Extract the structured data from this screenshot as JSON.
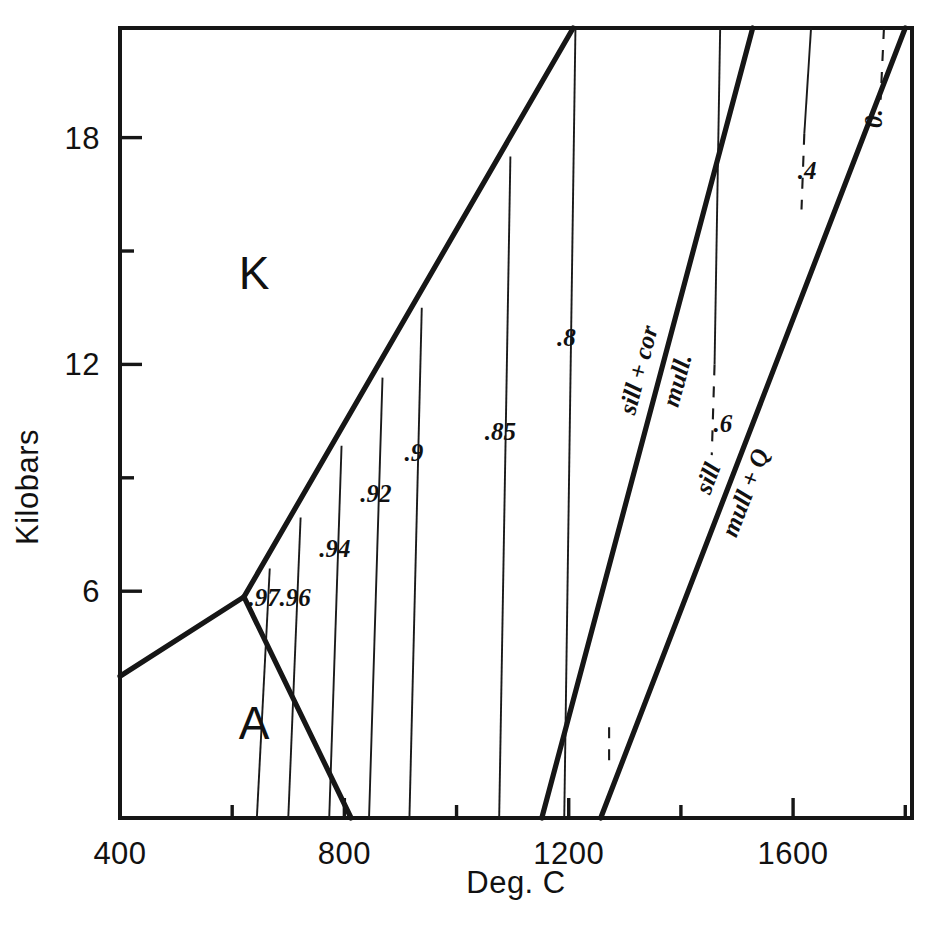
{
  "figure": {
    "background": "#ffffff",
    "ink": "#161616"
  },
  "chart_data": {
    "type": "line",
    "title": "",
    "xlabel": "Deg. C",
    "ylabel": "Kilobars",
    "xlim": [
      400,
      1812
    ],
    "ylim": [
      0.0,
      20.9
    ],
    "grid": false,
    "legend_position": "none",
    "x_ticks_major": [
      400,
      800,
      1200,
      1600
    ],
    "x_ticks_major_labels": [
      "400",
      "800",
      "1200",
      "1600"
    ],
    "x_ticks_minor": [
      600,
      1000,
      1400,
      1800
    ],
    "y_ticks_major": [
      6,
      12,
      18
    ],
    "y_ticks_major_labels": [
      "6",
      "12",
      "18"
    ],
    "y_ticks_minor": [
      9,
      15
    ],
    "regions": [
      {
        "name": "kyanite-field",
        "label": "K",
        "x": 640,
        "y": 14.0
      },
      {
        "name": "andalusite-field",
        "label": "A",
        "x": 640,
        "y": 2.1
      }
    ],
    "invariant_point": {
      "x": 621,
      "y": 5.85
    },
    "boundaries": [
      {
        "name": "kyanite-andalusite",
        "label": "",
        "points": [
          [
            400,
            3.75
          ],
          [
            621,
            5.85
          ]
        ]
      },
      {
        "name": "kyanite-sillimanite",
        "label": "",
        "points": [
          [
            621,
            5.85
          ],
          [
            1208,
            20.9
          ]
        ]
      },
      {
        "name": "andalusite-sillimanite",
        "label": "",
        "points": [
          [
            621,
            5.85
          ],
          [
            812,
            0.0
          ]
        ]
      },
      {
        "name": "sill-cor-mull",
        "label_above": "sill + cor",
        "label_below": "mull.",
        "points": [
          [
            1152,
            0.0
          ],
          [
            1528,
            20.9
          ]
        ]
      },
      {
        "name": "sill-mull-q",
        "label_above": "sill",
        "label_below": "mull + Q",
        "points": [
          [
            1257,
            0.0
          ],
          [
            1800,
            20.9
          ]
        ]
      }
    ],
    "contours": [
      {
        "label": ".97",
        "label_x": 657,
        "label_y": 5.6,
        "solid": [
          [
            667,
            6.6
          ],
          [
            644,
            0.0
          ]
        ]
      },
      {
        "label": ".96",
        "label_x": 712,
        "label_y": 5.6,
        "solid": [
          [
            722,
            7.95
          ],
          [
            700,
            0.0
          ]
        ]
      },
      {
        "label": ".94",
        "label_x": 783,
        "label_y": 6.9,
        "solid": [
          [
            795,
            9.85
          ],
          [
            773,
            0.0
          ]
        ]
      },
      {
        "label": ".92",
        "label_x": 856,
        "label_y": 8.35,
        "solid": [
          [
            868,
            11.65
          ],
          [
            844,
            0.0
          ]
        ]
      },
      {
        "label": ".9",
        "label_x": 924,
        "label_y": 9.45,
        "solid": [
          [
            938,
            13.5
          ],
          [
            916,
            0.0
          ]
        ]
      },
      {
        "label": ".85",
        "label_x": 1078,
        "label_y": 10.0,
        "solid": [
          [
            1096,
            17.5
          ],
          [
            1076,
            0.0
          ]
        ]
      },
      {
        "label": ".8",
        "label_x": 1196,
        "label_y": 12.5,
        "solid": [
          [
            1212,
            20.9
          ],
          [
            1192,
            0.0
          ]
        ]
      },
      {
        "label": ".6",
        "label_x": 1475,
        "label_y": 10.2,
        "solid": [
          [
            1470,
            20.9
          ],
          [
            1460,
            12.0
          ]
        ],
        "dashed": [
          [
            1460,
            12.0
          ],
          [
            1455,
            9.6
          ]
        ]
      },
      {
        "label": ".4",
        "label_x": 1625,
        "label_y": 16.9,
        "solid": [
          [
            1632,
            20.9
          ],
          [
            1620,
            18.1
          ]
        ],
        "dashed": [
          [
            1620,
            18.1
          ],
          [
            1615,
            16.1
          ]
        ]
      },
      {
        "label": "0.",
        "label_x": 1758,
        "label_y": 18.5,
        "dashed": [
          [
            1762,
            20.9
          ],
          [
            1756,
            19.0
          ]
        ]
      }
    ],
    "bottom_dash_marks": [
      {
        "name": "mull-q-bottom-dash",
        "x": 1272,
        "y0": 2.4,
        "y1": 1.35
      }
    ]
  },
  "axes": {
    "x_title": "Deg. C",
    "y_title": "Kilobars"
  }
}
